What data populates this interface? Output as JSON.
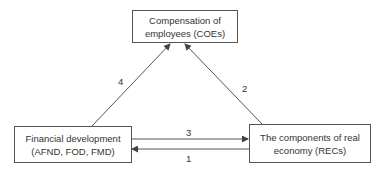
{
  "nodes": {
    "coe": {
      "line1": "Compensation of",
      "line2": "employees (COEs)"
    },
    "fd": {
      "line1": "Financial development",
      "line2": "(AFND, FOD, FMD)"
    },
    "rec": {
      "line1": "The components of real",
      "line2": "economy (RECs)"
    }
  },
  "edges": [
    {
      "id": "1",
      "label": "1",
      "from": "rec",
      "to": "fd"
    },
    {
      "id": "2",
      "label": "2",
      "from": "rec",
      "to": "coe"
    },
    {
      "id": "3",
      "label": "3",
      "from": "fd",
      "to": "rec"
    },
    {
      "id": "4",
      "label": "4",
      "from": "fd",
      "to": "coe"
    }
  ],
  "colors": {
    "stroke": "#555555",
    "text": "#333333"
  }
}
